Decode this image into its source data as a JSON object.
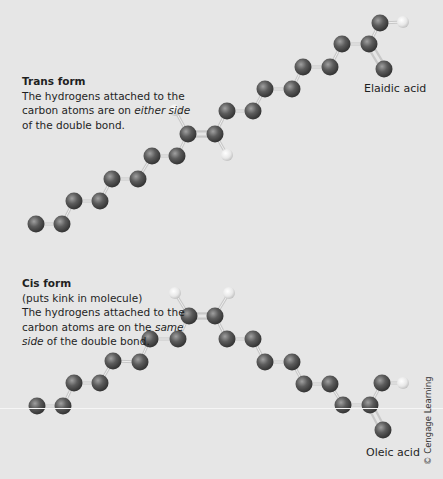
{
  "colors": {
    "background": "#e6e6e6",
    "carbon": "#555555",
    "hydrogen": "#f0f0f0",
    "bond": "#c8c8c8"
  },
  "trans": {
    "title": "Trans form",
    "line1": "The hydrogens attached to the",
    "line2_pre": "carbon atoms are on ",
    "line2_em": "either side",
    "line3": "of the double bond.",
    "molecule_name": "Elaidic acid"
  },
  "cis": {
    "title": "Cis form",
    "subtitle": "(puts kink in molecule)",
    "line1": "The hydrogens attached to the",
    "line2_pre": "carbon atoms are on the ",
    "line2_em": "same",
    "line3_em": "side",
    "line3_post": " of the double bond.",
    "molecule_name": "Oleic acid"
  },
  "credit": "© Cengage Learning",
  "molecules": {
    "elaidic": {
      "carbons": [
        [
          36,
          224
        ],
        [
          62,
          224
        ],
        [
          74,
          201
        ],
        [
          100,
          201
        ],
        [
          112,
          179
        ],
        [
          138,
          179
        ],
        [
          152,
          156
        ],
        [
          177,
          156
        ],
        [
          188,
          134
        ],
        [
          215,
          134
        ],
        [
          227,
          111
        ],
        [
          253,
          111
        ],
        [
          265,
          89
        ],
        [
          292,
          89
        ],
        [
          303,
          67
        ],
        [
          330,
          67
        ],
        [
          342,
          44
        ],
        [
          369,
          44
        ]
      ],
      "acid": {
        "c": [
          369,
          44
        ],
        "oh_o": [
          380,
          23
        ],
        "oh_h": [
          403,
          22
        ],
        "o_double": [
          384,
          69
        ]
      },
      "double_bond": [
        [
          188,
          134
        ],
        [
          215,
          134
        ]
      ],
      "hydrogens": [
        {
          "h": [
            175,
            110
          ],
          "c": [
            188,
            134
          ]
        },
        {
          "h": [
            227,
            155
          ],
          "c": [
            215,
            134
          ]
        }
      ]
    },
    "oleic": {
      "carbons": [
        [
          37,
          406
        ],
        [
          63,
          406
        ],
        [
          74,
          383
        ],
        [
          100,
          383
        ],
        [
          113,
          361
        ],
        [
          140,
          362
        ],
        [
          150,
          339
        ],
        [
          178,
          339
        ],
        [
          189,
          316
        ],
        [
          215,
          316
        ],
        [
          227,
          339
        ],
        [
          253,
          339
        ],
        [
          265,
          362
        ],
        [
          292,
          362
        ],
        [
          304,
          384
        ],
        [
          330,
          384
        ],
        [
          343,
          405
        ],
        [
          370,
          405
        ]
      ],
      "acid": {
        "c": [
          370,
          405
        ],
        "oh_o": [
          382,
          383
        ],
        "oh_h": [
          403,
          383
        ],
        "o_double": [
          383,
          430
        ]
      },
      "double_bond": [
        [
          189,
          316
        ],
        [
          215,
          316
        ]
      ],
      "hydrogens": [
        {
          "h": [
            175,
            293
          ],
          "c": [
            189,
            316
          ]
        },
        {
          "h": [
            229,
            293
          ],
          "c": [
            215,
            316
          ]
        }
      ]
    }
  }
}
